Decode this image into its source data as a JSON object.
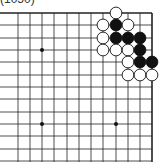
{
  "diagram": {
    "title": "(1050)",
    "board": {
      "columns_x": [
        18,
        30,
        42,
        54,
        67,
        79,
        91,
        103,
        116,
        128,
        140,
        152
      ],
      "rows_y": [
        13,
        25,
        38,
        50,
        62,
        75,
        87,
        99,
        112,
        124,
        136,
        149,
        161
      ],
      "hoshi": [
        [
          2,
          3
        ],
        [
          2,
          9
        ],
        [
          8,
          9
        ]
      ],
      "stones": [
        {
          "color": "white",
          "col": 8,
          "row": 0
        },
        {
          "color": "white",
          "col": 7,
          "row": 1
        },
        {
          "color": "black",
          "col": 8,
          "row": 1
        },
        {
          "color": "white",
          "col": 9,
          "row": 1
        },
        {
          "color": "white",
          "col": 7,
          "row": 2
        },
        {
          "color": "black",
          "col": 8,
          "row": 2
        },
        {
          "color": "black",
          "col": 9,
          "row": 2
        },
        {
          "color": "black",
          "col": 10,
          "row": 2
        },
        {
          "color": "white",
          "col": 7,
          "row": 3
        },
        {
          "color": "white",
          "col": 8,
          "row": 3
        },
        {
          "color": "white",
          "col": 9,
          "row": 3
        },
        {
          "color": "black",
          "col": 10,
          "row": 3
        },
        {
          "color": "white",
          "col": 9,
          "row": 4
        },
        {
          "color": "black",
          "col": 10,
          "row": 4
        },
        {
          "color": "black",
          "col": 11,
          "row": 4
        },
        {
          "color": "white",
          "col": 9,
          "row": 5
        },
        {
          "color": "white",
          "col": 10,
          "row": 5
        },
        {
          "color": "white",
          "col": 11,
          "row": 5
        }
      ]
    }
  }
}
